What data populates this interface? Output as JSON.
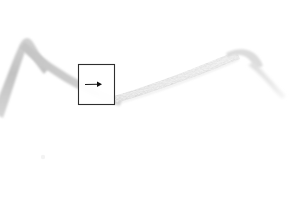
{
  "image": {
    "width": 305,
    "height": 206,
    "background_color": "#ffffff",
    "description": "Pale grey elongated filamentous structure on a white background with a square region-of-interest box and a right-pointing arrow marker"
  },
  "specimen": {
    "name": "filament-strand",
    "primary_color": "#c8c8c8",
    "secondary_color": "#d8d8d8",
    "highlight_color": "#e6e6e6",
    "segments": [
      {
        "name": "left-descending-limb",
        "tone": "#c5c5c5",
        "from": [
          0,
          104
        ],
        "apex": [
          21,
          41
        ],
        "to": [
          46,
          63
        ]
      },
      {
        "name": "valley-descent",
        "tone": "#c9c9c9",
        "from": [
          24,
          45
        ],
        "to": [
          118,
          94
        ]
      },
      {
        "name": "rising-textured-limb",
        "tone": "#dcdcdc",
        "from": [
          116,
          95
        ],
        "to": [
          232,
          52
        ]
      },
      {
        "name": "distal-taper",
        "tone": "#e2e2e2",
        "from": [
          236,
          52
        ],
        "to": [
          284,
          92
        ]
      }
    ]
  },
  "annotations": {
    "roi_box": {
      "name": "region-of-interest-box",
      "x": 78,
      "y": 64,
      "width": 37,
      "height": 41,
      "stroke_color": "#2e2e2e",
      "stroke_width": 1.1,
      "fill_color": "#ffffff"
    },
    "arrow_marker": {
      "name": "pointer-arrow",
      "shaft_start": [
        85,
        85
      ],
      "shaft_end": [
        99,
        84
      ],
      "head_tip": [
        102,
        84
      ],
      "direction": "right",
      "color": "#101010"
    },
    "speck": {
      "name": "faint-speck",
      "x": 43,
      "y": 157,
      "radius": 2.2,
      "color": "#f3f3f3"
    }
  },
  "caption": {
    "alt_text": "Greyscale micrograph of a slender filament with a boxed detail region and an arrow indicating a feature"
  }
}
